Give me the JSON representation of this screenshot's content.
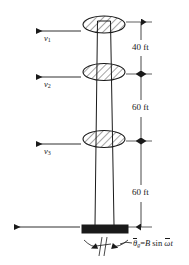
{
  "figure": {
    "type": "engineering-diagram",
    "background_color": "#ffffff",
    "line_color": "#1a1a1a",
    "foundation_color": "#1a1a1a",
    "velocities": [
      {
        "id": "v1",
        "symbol": "v",
        "subscript": "1",
        "level": "roof"
      },
      {
        "id": "v2",
        "symbol": "v",
        "subscript": "2",
        "level": "third-floor"
      },
      {
        "id": "v3",
        "symbol": "v",
        "subscript": "3",
        "level": "second-floor"
      }
    ],
    "dimensions": [
      {
        "id": "dim-top",
        "label": "40 ft",
        "value": 40,
        "unit": "ft"
      },
      {
        "id": "dim-middle",
        "label": "60 ft",
        "value": 60,
        "unit": "ft"
      },
      {
        "id": "dim-bottom",
        "label": "60 ft",
        "value": 60,
        "unit": "ft"
      }
    ],
    "ground_motion": {
      "symbol": "θ",
      "subscript": "g",
      "equals": "=",
      "amplitude": "B",
      "function": "sin",
      "frequency": "ω",
      "time": "t",
      "full": "θ̄g=B sin ω̄t"
    },
    "floors": [
      {
        "id": "floor-1",
        "shape": "hatched-ellipse"
      },
      {
        "id": "floor-2",
        "shape": "hatched-ellipse"
      },
      {
        "id": "floor-3",
        "shape": "hatched-ellipse"
      }
    ]
  }
}
